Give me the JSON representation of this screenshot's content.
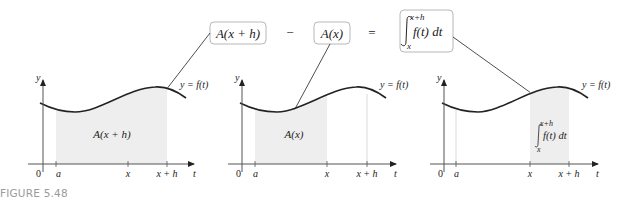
{
  "equation": {
    "term1": "A(x + h)",
    "minus": "−",
    "term2": "A(x)",
    "equals": "=",
    "integral": {
      "upper": "x+h",
      "lower": "x",
      "integrand": "f(t) dt"
    }
  },
  "panels": [
    {
      "id": "panel-1",
      "y_label": "y",
      "t_label": "t",
      "curve_label": "y = f(t)",
      "origin_label": "0",
      "ticks": [
        "a",
        "x",
        "x + h"
      ],
      "region_label": "A(x + h)",
      "shaded_from": "a",
      "shaded_to": "x + h"
    },
    {
      "id": "panel-2",
      "y_label": "y",
      "t_label": "t",
      "curve_label": "y = f(t)",
      "origin_label": "0",
      "ticks": [
        "a",
        "x",
        "x + h"
      ],
      "region_label": "A(x)",
      "shaded_from": "a",
      "shaded_to": "x"
    },
    {
      "id": "panel-3",
      "y_label": "y",
      "t_label": "t",
      "curve_label": "y = f(t)",
      "origin_label": "0",
      "ticks": [
        "a",
        "x",
        "x + h"
      ],
      "region_label": {
        "upper": "x+h",
        "lower": "x",
        "integrand": "f(t) dt"
      },
      "shaded_from": "x",
      "shaded_to": "x + h"
    }
  ],
  "caption": "FIGURE 5.48",
  "colors": {
    "shade": "#eeeeee",
    "box_border": "#b8b8b8",
    "caption": "#9a9a9a",
    "ink": "#222222"
  }
}
